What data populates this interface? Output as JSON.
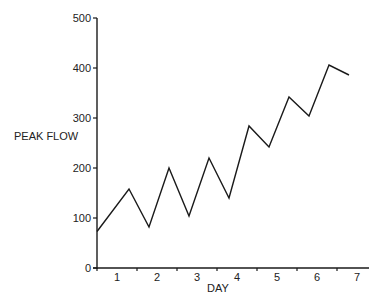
{
  "chart_data": {
    "type": "line",
    "title": "",
    "xlabel": "DAY",
    "ylabel": "PEAK FLOW",
    "ylim": [
      0,
      500
    ],
    "xlim": [
      0.5,
      7.3
    ],
    "yticks": [
      0,
      100,
      200,
      300,
      400,
      500
    ],
    "xticks": [
      1,
      2,
      3,
      4,
      5,
      6,
      7
    ],
    "grid": false,
    "legend": null,
    "series": [
      {
        "name": "Peak flow",
        "x": [
          0.5,
          1.3,
          1.8,
          2.3,
          2.8,
          3.3,
          3.8,
          4.3,
          4.8,
          5.3,
          5.8,
          6.3,
          6.8
        ],
        "values": [
          73,
          158,
          82,
          200,
          104,
          220,
          140,
          284,
          242,
          342,
          304,
          406,
          386
        ]
      }
    ]
  }
}
